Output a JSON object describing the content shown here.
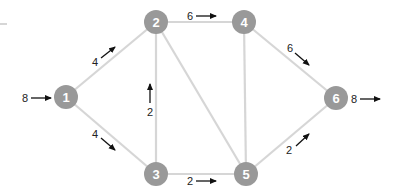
{
  "diagram": {
    "type": "flow-network",
    "node_color": "#999999",
    "edge_color": "#d6d6d6",
    "arrow_color": "#111111",
    "nodes": [
      {
        "id": "1",
        "label": "1",
        "x": 66,
        "y": 97
      },
      {
        "id": "2",
        "label": "2",
        "x": 156,
        "y": 22
      },
      {
        "id": "3",
        "label": "3",
        "x": 156,
        "y": 174
      },
      {
        "id": "4",
        "label": "4",
        "x": 244,
        "y": 22
      },
      {
        "id": "5",
        "label": "5",
        "x": 246,
        "y": 174
      },
      {
        "id": "6",
        "label": "6",
        "x": 336,
        "y": 98
      }
    ],
    "edges": [
      {
        "from": "1",
        "to": "2",
        "flow": "4"
      },
      {
        "from": "1",
        "to": "3",
        "flow": "4"
      },
      {
        "from": "3",
        "to": "2",
        "flow": "2"
      },
      {
        "from": "2",
        "to": "4",
        "flow": "6"
      },
      {
        "from": "2",
        "to": "5",
        "flow": ""
      },
      {
        "from": "4",
        "to": "5",
        "flow": ""
      },
      {
        "from": "3",
        "to": "5",
        "flow": "2"
      },
      {
        "from": "4",
        "to": "6",
        "flow": "6"
      },
      {
        "from": "5",
        "to": "6",
        "flow": "2"
      }
    ],
    "source_inflow": {
      "node": "1",
      "label": "8"
    },
    "sink_outflow": {
      "node": "6",
      "label": "8"
    }
  },
  "labels": {
    "in_flow": "8",
    "out_flow": "8",
    "e12": "4",
    "e13": "4",
    "e32": "2",
    "e24": "6",
    "e35": "2",
    "e46": "6",
    "e56": "2",
    "n1": "1",
    "n2": "2",
    "n3": "3",
    "n4": "4",
    "n5": "5",
    "n6": "6"
  }
}
